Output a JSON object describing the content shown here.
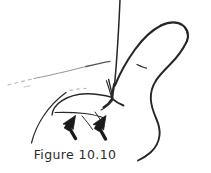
{
  "figure": {
    "caption": "Figure 10.10",
    "background_color": "#ffffff",
    "ink_color": "#262626",
    "arrow_color": "#1a1a1a",
    "faint_ink_color": "#8d8d8d",
    "annotations": [
      {
        "name": "force-arrow-left",
        "label": "",
        "direction": "up-left"
      },
      {
        "name": "force-arrow-right",
        "label": "",
        "direction": "up-left"
      }
    ],
    "parts": [
      {
        "name": "index-finger-stem",
        "label": ""
      },
      {
        "name": "thumb-body",
        "label": ""
      },
      {
        "name": "thumb-tip-nail",
        "label": ""
      },
      {
        "name": "knuckle-crease",
        "label": ""
      },
      {
        "name": "web-space-junction",
        "label": ""
      },
      {
        "name": "palm-contour",
        "label": ""
      },
      {
        "name": "wrist-contour",
        "label": ""
      },
      {
        "name": "dashed-guide-curve",
        "label": ""
      }
    ]
  }
}
